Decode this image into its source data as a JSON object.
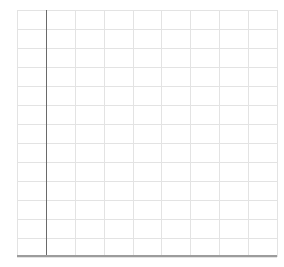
{
  "canvas": {
    "width": 284,
    "height": 267,
    "background": "#ffffff"
  },
  "chart_data": {
    "type": "scatter",
    "title": "",
    "xlabel": "",
    "ylabel": "",
    "x_ticks": [],
    "y_ticks": [],
    "series": [],
    "annotations": [],
    "legend": "none",
    "grid": "on",
    "note": "Empty plot area: gridlines and bare axes only; no data points, tick labels, titles, or text are rendered in the image."
  },
  "plot": {
    "left": 17,
    "top": 10,
    "width": 260,
    "height": 247,
    "columns": 9,
    "rows": 13,
    "gridline_color": "#e3e3e3",
    "gridline_width": 1,
    "y_axis": {
      "x_offset": 29,
      "color": "#6a6a6a",
      "width": 1
    },
    "x_axis": {
      "position": "bottom",
      "color": "#9c9c9c",
      "width": 2
    }
  }
}
